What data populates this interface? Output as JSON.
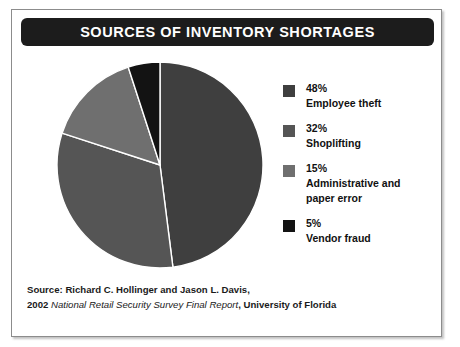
{
  "figure": {
    "title": "SOURCES OF INVENTORY SHORTAGES",
    "banner_color": "#1c1c1c",
    "banner_text_color": "#ffffff",
    "frame_border_color": "#8c8c8c",
    "background": "#ffffff"
  },
  "legend": {
    "items": [
      {
        "percent": "48%",
        "label": "Employee theft",
        "color": "#3f3f3f",
        "swatch_name": "legend-swatch-employee-theft"
      },
      {
        "percent": "32%",
        "label": "Shoplifting",
        "color": "#555555",
        "swatch_name": "legend-swatch-shoplifting"
      },
      {
        "percent": "15%",
        "label": "Administrative and",
        "label2": "paper error",
        "color": "#6f6f6f",
        "swatch_name": "legend-swatch-administrative"
      },
      {
        "percent": "5%",
        "label": "Vendor fraud",
        "color": "#131313",
        "swatch_name": "legend-swatch-vendor-fraud"
      }
    ]
  },
  "source": {
    "line1": "Source: Richard C. Hollinger and Jason L. Davis,",
    "line2_prefix": "2002 ",
    "line2_italic": "National Retail Security Survey Final Report",
    "line2_suffix": ", University of Florida"
  },
  "chart_data": {
    "type": "pie",
    "title": "SOURCES OF INVENTORY SHORTAGES",
    "categories": [
      "Employee theft",
      "Shoplifting",
      "Administrative and paper error",
      "Vendor fraud"
    ],
    "values": [
      48,
      32,
      15,
      5
    ],
    "value_labels": [
      "48%",
      "32%",
      "15%",
      "5%"
    ],
    "colors": [
      "#3f3f3f",
      "#555555",
      "#6f6f6f",
      "#131313"
    ],
    "units": "percent",
    "start_angle_deg": 0,
    "direction": "clockwise",
    "slice_separator_color": "#ffffff",
    "legend_position": "right",
    "grid": false,
    "source": "Source: Richard C. Hollinger and Jason L. Davis, 2002 National Retail Security Survey Final Report, University of Florida"
  }
}
